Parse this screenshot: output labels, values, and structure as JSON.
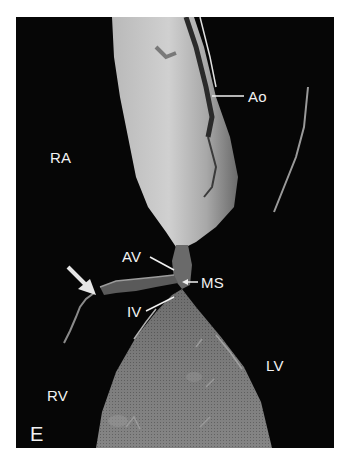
{
  "figure": {
    "panel_letter": "E",
    "background_color": "#060606",
    "labels": {
      "aorta": "Ao",
      "right_atrium": "RA",
      "aortic_valve": "AV",
      "membranous_septum": "MS",
      "interventricular": "IV",
      "left_ventricle": "LV",
      "right_ventricle": "RV"
    },
    "annotations": {
      "white_arrow": "arrow pointing to tissue edge near right ventricle"
    }
  }
}
